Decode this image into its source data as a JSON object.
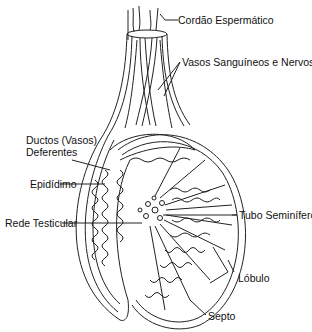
{
  "diagram": {
    "labels": {
      "cordao": "Cordão Espermático",
      "vasos": "Vasos Sanguíneos e Nervos",
      "ductos_line1": "Ductos (Vasos)",
      "ductos_line2": "Deferentes",
      "epididimo": "Epidídimo",
      "rede": "Rede Testicular",
      "tubo": "Tubo Seminífero",
      "lobulo": "Lóbulo",
      "septo": "Septo"
    },
    "colors": {
      "stroke": "#222222",
      "background": "#ffffff",
      "text": "#111111"
    }
  }
}
